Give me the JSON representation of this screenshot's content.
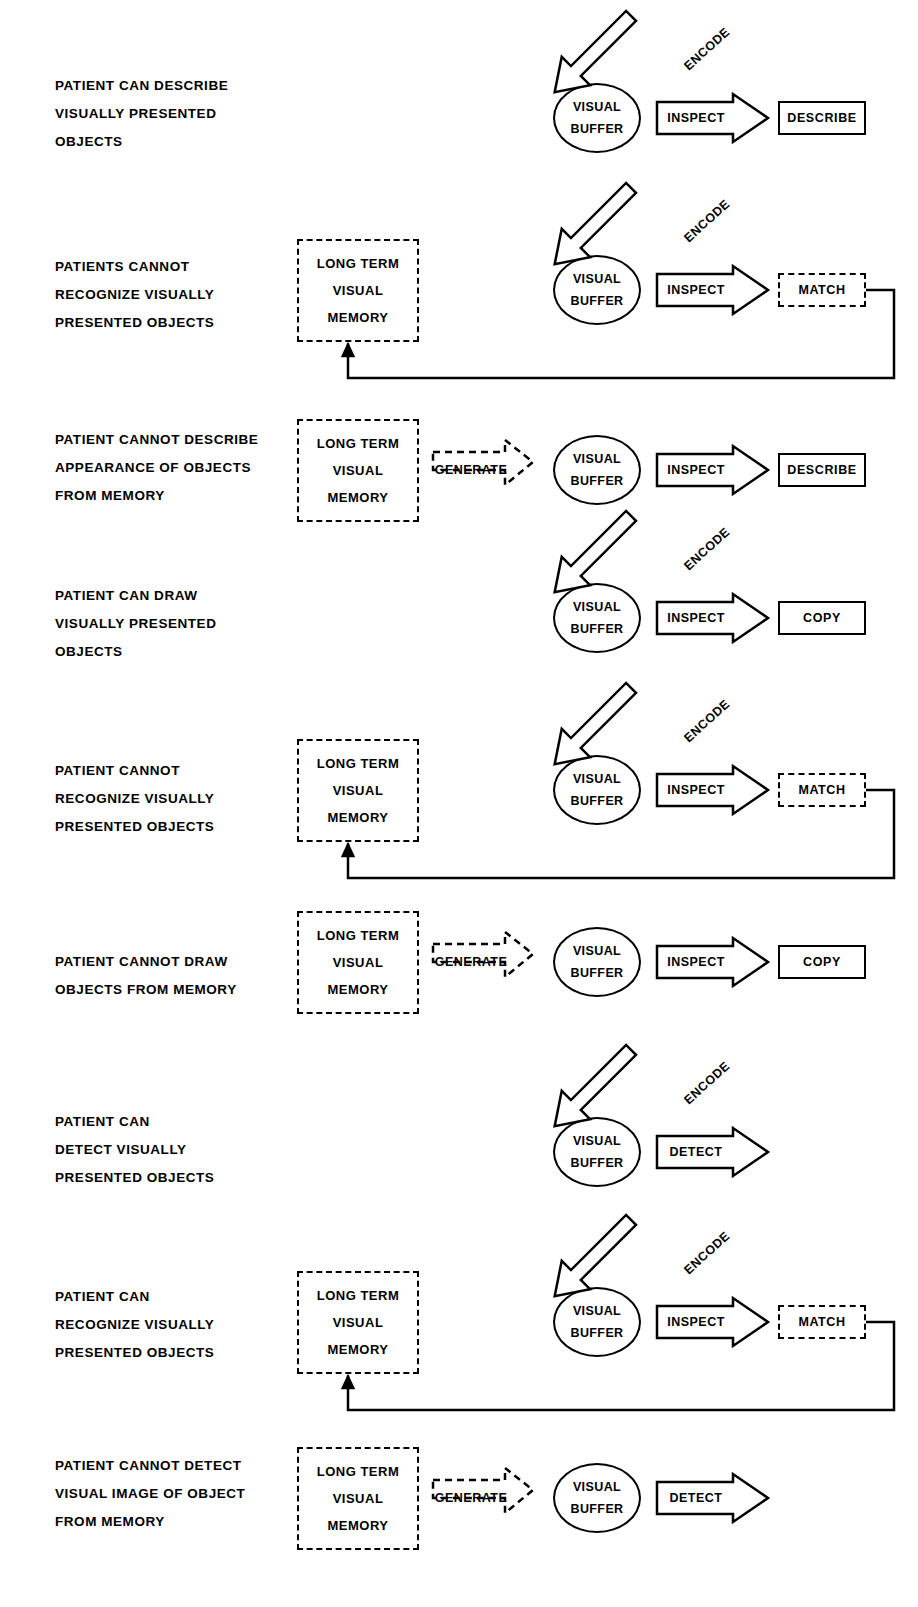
{
  "figure": {
    "labels": {
      "visual_buffer_line1": "VISUAL",
      "visual_buffer_line2": "BUFFER",
      "ltm_line1": "LONG TERM",
      "ltm_line2": "VISUAL",
      "ltm_line3": "MEMORY",
      "encode": "ENCODE",
      "inspect": "INSPECT",
      "detect": "DETECT",
      "generate": "GENERATE",
      "describe": "DESCRIBE",
      "match": "MATCH",
      "copy": "COPY"
    },
    "rows": [
      {
        "id": "row-1-can-describe-visually-presented",
        "description": [
          "PATIENT CAN DESCRIBE",
          "VISUALLY  PRESENTED",
          "OBJECTS"
        ],
        "has_ltm": false,
        "has_generate": false,
        "has_encode": true,
        "process": "INSPECT",
        "terminal": "DESCRIBE",
        "terminal_dashed": false,
        "has_feedback": false
      },
      {
        "id": "row-2-cannot-recognize-visually-presented",
        "description": [
          "PATIENTS  CANNOT",
          "RECOGNIZE VISUALLY",
          "PRESENTED OBJECTS"
        ],
        "has_ltm": true,
        "has_generate": false,
        "has_encode": true,
        "process": "INSPECT",
        "terminal": "MATCH",
        "terminal_dashed": true,
        "has_feedback": true
      },
      {
        "id": "row-3-cannot-describe-appearance-from-memory",
        "description": [
          "PATIENT CANNOT DESCRIBE",
          "APPEARANCE OF OBJECTS",
          "FROM MEMORY"
        ],
        "has_ltm": true,
        "has_generate": true,
        "has_encode": false,
        "process": "INSPECT",
        "terminal": "DESCRIBE",
        "terminal_dashed": false,
        "has_feedback": false
      },
      {
        "id": "row-4-can-draw-visually-presented",
        "description": [
          "PATIENT CAN DRAW",
          "VISUALLY PRESENTED",
          "OBJECTS"
        ],
        "has_ltm": false,
        "has_generate": false,
        "has_encode": true,
        "process": "INSPECT",
        "terminal": "COPY",
        "terminal_dashed": false,
        "has_feedback": false
      },
      {
        "id": "row-5-cannot-recognize-visually-presented",
        "description": [
          "PATIENT  CANNOT",
          "RECOGNIZE VISUALLY",
          "PRESENTED  OBJECTS"
        ],
        "has_ltm": true,
        "has_generate": false,
        "has_encode": true,
        "process": "INSPECT",
        "terminal": "MATCH",
        "terminal_dashed": true,
        "has_feedback": true
      },
      {
        "id": "row-6-cannot-draw-objects-from-memory",
        "description": [
          "PATIENT CANNOT DRAW",
          "OBJECTS FROM MEMORY"
        ],
        "has_ltm": true,
        "has_generate": true,
        "has_encode": false,
        "process": "INSPECT",
        "terminal": "COPY",
        "terminal_dashed": false,
        "has_feedback": false
      },
      {
        "id": "row-7-can-detect-visually-presented",
        "description": [
          "PATIENT CAN",
          "DETECT VISUALLY",
          "PRESENTED OBJECTS"
        ],
        "has_ltm": false,
        "has_generate": false,
        "has_encode": true,
        "process": "DETECT",
        "terminal": null,
        "terminal_dashed": false,
        "has_feedback": false
      },
      {
        "id": "row-8-can-recognize-visually-presented",
        "description": [
          "PATIENT CAN",
          "RECOGNIZE VISUALLY",
          "PRESENTED OBJECTS"
        ],
        "has_ltm": true,
        "has_generate": false,
        "has_encode": true,
        "process": "INSPECT",
        "terminal": "MATCH",
        "terminal_dashed": true,
        "has_feedback": true
      },
      {
        "id": "row-9-cannot-detect-visual-image-from-memory",
        "description": [
          "PATIENT CANNOT DETECT",
          "VISUAL IMAGE OF OBJECT",
          "FROM MEMORY"
        ],
        "has_ltm": true,
        "has_generate": true,
        "has_encode": false,
        "process": "DETECT",
        "terminal": null,
        "terminal_dashed": false,
        "has_feedback": false
      }
    ],
    "colors": {
      "ink": "#000000",
      "paper": "#ffffff"
    }
  }
}
